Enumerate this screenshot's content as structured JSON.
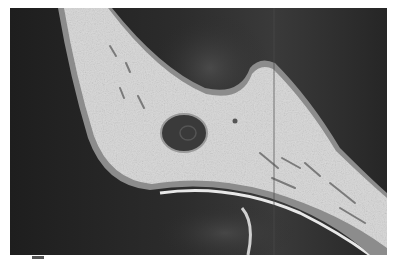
{
  "figure": {
    "type": "grayscale micrograph",
    "colors": {
      "background_dark": "#2a2a2a",
      "tissue_light": "#d8d8d8",
      "tissue_edge": "#9a9a9a",
      "lacuna": "#3a3a3a",
      "page": "#ffffff"
    }
  }
}
